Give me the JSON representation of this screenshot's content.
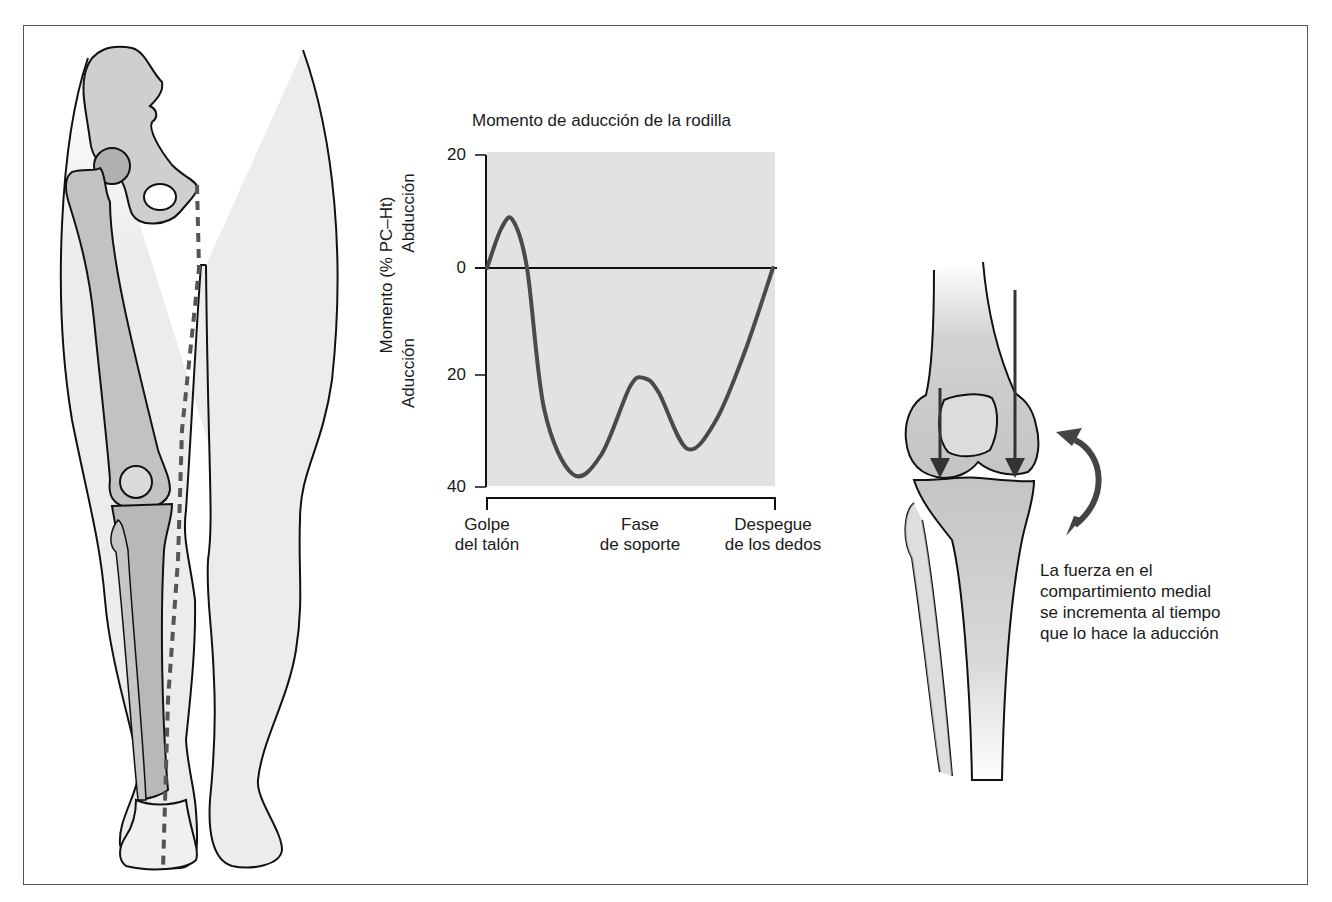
{
  "chart_data": {
    "type": "line",
    "title": "Momento de aducción de la rodilla",
    "ylabel": "Momento (% PC–Ht)",
    "ylabel_upper": "Abducción",
    "ylabel_lower": "Aducción",
    "xlabel": "",
    "y_ticks": [
      "20",
      "0",
      "20",
      "40"
    ],
    "y_tick_values": [
      20,
      0,
      -20,
      -40
    ],
    "ylim": [
      -40,
      20
    ],
    "x_tick_labels": [
      {
        "line1": "Golpe",
        "line2": "del talón"
      },
      {
        "line1": "Fase",
        "line2": "de soporte"
      },
      {
        "line1": "Despegue",
        "line2": "de los dedos"
      }
    ],
    "x": [
      0,
      5,
      9,
      14,
      20,
      30,
      40,
      50,
      55,
      60,
      70,
      80,
      90,
      100
    ],
    "series": [
      {
        "name": "Momento de aducción de la rodilla",
        "values": [
          0,
          7,
          8.5,
          0,
          -25,
          -36.5,
          -33,
          -21,
          -19.5,
          -22,
          -32,
          -27,
          -15,
          0
        ]
      }
    ],
    "grid": false,
    "background_shaded": true
  },
  "annotations": {
    "caption": [
      "La fuerza en el",
      "compartimiento medial",
      "se incrementa al tiempo",
      "que lo hace la aducción"
    ]
  },
  "colors": {
    "plot_bg": "#e2e2e2",
    "curve": "#4a4a4a",
    "bone_fill": "#c9c9c9",
    "bone_dark": "#a8a8a8",
    "limb_fill": "#ececec",
    "dashed_line": "#555555",
    "arrow": "#444444"
  }
}
